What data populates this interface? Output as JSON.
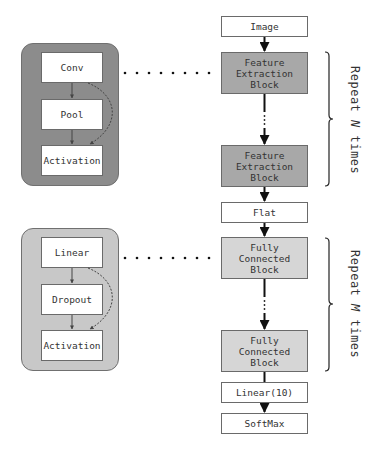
{
  "main_flow": {
    "image": "Image",
    "feature_block_1": "Feature\nExtraction\nBlock",
    "feature_block_2": "Feature\nExtraction\nBlock",
    "flat": "Flat",
    "fc_block_1": "Fully\nConnected\nBlock",
    "fc_block_2": "Fully\nConnected\nBlock",
    "linear10": "Linear(10)",
    "softmax": "SoftMax"
  },
  "feature_detail": {
    "items": [
      "Conv",
      "Pool",
      "Activation"
    ]
  },
  "fc_detail": {
    "items": [
      "Linear",
      "Dropout",
      "Activation"
    ]
  },
  "annotations": {
    "repeat_n_prefix": "Repeat ",
    "repeat_n_var": "N",
    "repeat_n_suffix": " times",
    "repeat_m_prefix": "Repeat ",
    "repeat_m_var": "M",
    "repeat_m_suffix": " times"
  },
  "colors": {
    "feature_group_bg": "#8c8c8c",
    "fc_group_bg": "#c8c8c8",
    "feature_block_bg": "#a8a8a8",
    "fc_block_bg": "#d6d6d6"
  }
}
